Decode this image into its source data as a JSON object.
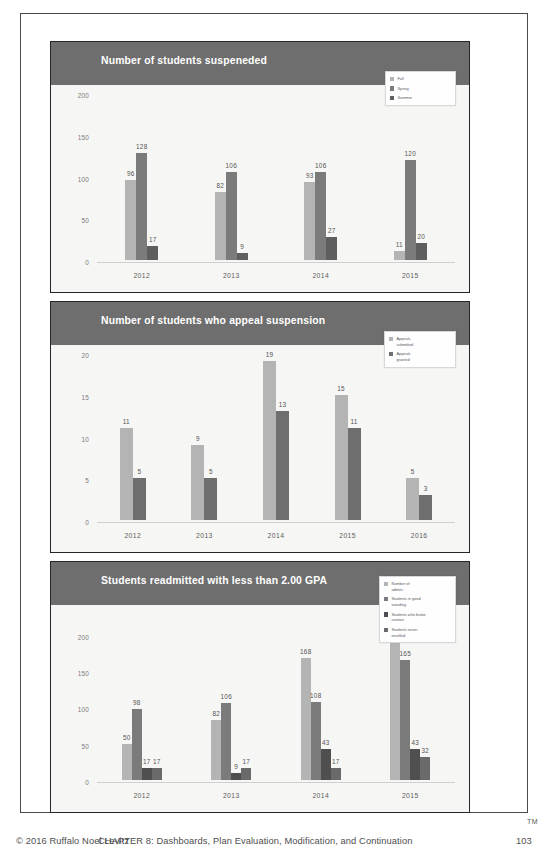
{
  "footer": {
    "copyright": "© 2016 Ruffalo Noel Levitz",
    "chapter": "CHAPTER 8: Dashboards, Plan Evaluation, Modification, and Continuation",
    "page_number": "103",
    "trademark": "TM"
  },
  "colors": {
    "header_bar": "#6e6e6e",
    "series_1": "#b4b4b4",
    "series_2": "#7b7b7b",
    "series_3": "#5e5e5e",
    "series_4": "#6a6a6a",
    "panel_bg": "#f6f6f4",
    "frame": "#262626"
  },
  "chart_data": [
    {
      "type": "bar",
      "title": "Number of students suspeneded",
      "categories": [
        "2012",
        "2013",
        "2014",
        "2015"
      ],
      "series": [
        {
          "name": "Fall",
          "color": "#b4b4b4",
          "values": [
            96,
            82,
            93,
            11
          ]
        },
        {
          "name": "Spring",
          "color": "#7b7b7b",
          "values": [
            128,
            106,
            106,
            120
          ]
        },
        {
          "name": "Summer",
          "color": "#5e5e5e",
          "values": [
            17,
            9,
            27,
            20
          ]
        }
      ],
      "xlabel": "",
      "ylabel": "",
      "ylim": [
        0,
        200
      ],
      "yticks": [
        "0",
        "50",
        "100",
        "150",
        "200"
      ],
      "grid": false,
      "legend_position": "top-right"
    },
    {
      "type": "bar",
      "title": "Number of students who appeal suspension",
      "categories": [
        "2012",
        "2013",
        "2014",
        "2015",
        "2016"
      ],
      "series": [
        {
          "name": "Appeals\nsubmitted",
          "color": "#b4b4b4",
          "values": [
            11,
            9,
            19,
            15,
            5
          ]
        },
        {
          "name": "Appeals\ngranted",
          "color": "#6e6e6e",
          "values": [
            5,
            5,
            13,
            11,
            3
          ]
        }
      ],
      "xlabel": "",
      "ylabel": "",
      "ylim": [
        0,
        20
      ],
      "yticks": [
        "0",
        "5",
        "10",
        "15",
        "20"
      ],
      "grid": false,
      "legend_position": "top-right"
    },
    {
      "type": "bar",
      "title": "Students readmitted with less than 2.00 GPA",
      "categories": [
        "2012",
        "2013",
        "2014",
        "2015"
      ],
      "series": [
        {
          "name": "Number of\nadmits",
          "color": "#b4b4b4",
          "values": [
            50,
            82,
            168,
            212
          ]
        },
        {
          "name": "Students in good\nstanding",
          "color": "#7b7b7b",
          "values": [
            98,
            106,
            108,
            165
          ]
        },
        {
          "name": "Students who broke\ncontact",
          "color": "#4f4f4f",
          "values": [
            17,
            9,
            43,
            43
          ]
        },
        {
          "name": "Students never\nenrolled",
          "color": "#6a6a6a",
          "values": [
            17,
            17,
            17,
            32
          ]
        }
      ],
      "xlabel": "",
      "ylabel": "",
      "ylim": [
        0,
        230
      ],
      "yticks": [
        "0",
        "50",
        "100",
        "150",
        "200"
      ],
      "grid": false,
      "legend_position": "top-right"
    }
  ]
}
